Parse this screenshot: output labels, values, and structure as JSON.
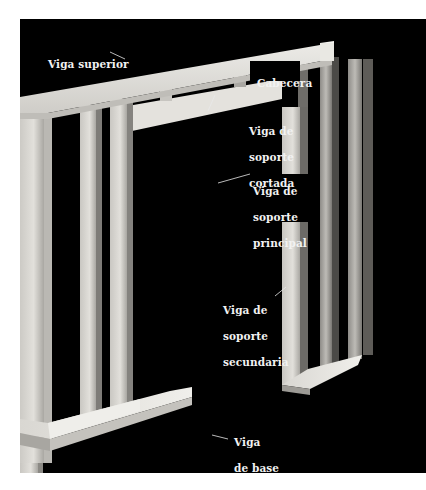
{
  "figure": {
    "background_color": "#000000",
    "wood_color": "#d8d6d0",
    "labels": [
      {
        "id": "top-plate",
        "lines": [
          "Viga superior"
        ]
      },
      {
        "id": "header",
        "lines": [
          "Cabecera"
        ]
      },
      {
        "id": "cripple-stud",
        "lines": [
          "Viga de",
          "soporte",
          "cortada"
        ]
      },
      {
        "id": "king-stud",
        "lines": [
          "Viga de",
          "soporte",
          "principal"
        ]
      },
      {
        "id": "jack-stud",
        "lines": [
          "Viga de",
          "soporte",
          "secundaria"
        ]
      },
      {
        "id": "sole-plate",
        "lines": [
          "Viga",
          "de base",
          "inferior"
        ]
      }
    ]
  }
}
